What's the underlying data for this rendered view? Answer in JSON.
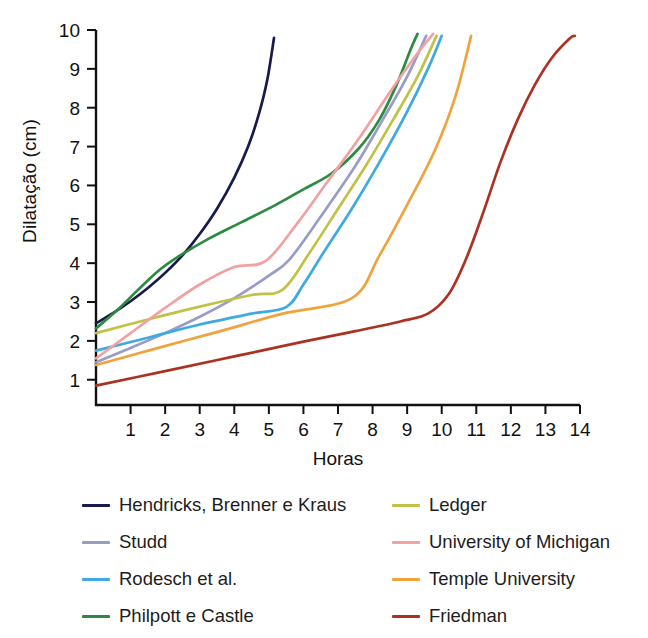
{
  "chart_data": {
    "type": "line",
    "title": "",
    "xlabel": "Horas",
    "ylabel": "Dilatação (cm)",
    "xlim": [
      0,
      14
    ],
    "ylim": [
      0.35,
      10
    ],
    "xticks": [
      1,
      2,
      3,
      4,
      5,
      6,
      7,
      8,
      9,
      10,
      11,
      12,
      13,
      14
    ],
    "yticks": [
      1,
      2,
      3,
      4,
      5,
      6,
      7,
      8,
      9,
      10
    ],
    "grid": false,
    "legend_position": "below",
    "legend_columns": 2,
    "series": [
      {
        "name": "Hendricks, Brenner e Kraus",
        "color": "#171a4a",
        "points": [
          [
            0,
            2.45
          ],
          [
            0.5,
            2.72
          ],
          [
            1.0,
            3.02
          ],
          [
            1.5,
            3.36
          ],
          [
            2.0,
            3.75
          ],
          [
            2.5,
            4.2
          ],
          [
            3.0,
            4.75
          ],
          [
            3.5,
            5.4
          ],
          [
            4.0,
            6.2
          ],
          [
            4.4,
            7.0
          ],
          [
            4.7,
            7.8
          ],
          [
            4.95,
            8.7
          ],
          [
            5.15,
            9.8
          ]
        ]
      },
      {
        "name": "Studd",
        "color": "#9a9cc8",
        "points": [
          [
            0,
            1.45
          ],
          [
            1.0,
            1.82
          ],
          [
            2.0,
            2.2
          ],
          [
            3.0,
            2.62
          ],
          [
            4.0,
            3.1
          ],
          [
            5.0,
            3.68
          ],
          [
            5.6,
            4.1
          ],
          [
            6.5,
            5.2
          ],
          [
            7.5,
            6.5
          ],
          [
            8.3,
            7.7
          ],
          [
            9.0,
            8.8
          ],
          [
            9.55,
            9.85
          ]
        ]
      },
      {
        "name": "Rodesch et al.",
        "color": "#3eaae0",
        "points": [
          [
            0,
            1.75
          ],
          [
            1.5,
            2.08
          ],
          [
            3.0,
            2.42
          ],
          [
            4.5,
            2.7
          ],
          [
            5.5,
            2.87
          ],
          [
            6.0,
            3.45
          ],
          [
            6.6,
            4.3
          ],
          [
            7.4,
            5.4
          ],
          [
            8.2,
            6.6
          ],
          [
            9.0,
            7.9
          ],
          [
            9.6,
            9.0
          ],
          [
            10.0,
            9.85
          ]
        ]
      },
      {
        "name": "Philpott e Castle",
        "color": "#2d8a40",
        "points": [
          [
            0,
            2.32
          ],
          [
            0.6,
            2.78
          ],
          [
            1.2,
            3.3
          ],
          [
            1.8,
            3.8
          ],
          [
            2.4,
            4.18
          ],
          [
            3.2,
            4.6
          ],
          [
            4.2,
            5.05
          ],
          [
            5.2,
            5.5
          ],
          [
            6.0,
            5.9
          ],
          [
            6.8,
            6.3
          ],
          [
            7.6,
            6.95
          ],
          [
            8.2,
            7.7
          ],
          [
            8.7,
            8.6
          ],
          [
            9.1,
            9.5
          ],
          [
            9.3,
            9.9
          ]
        ]
      },
      {
        "name": "Ledger",
        "color": "#c0c246",
        "points": [
          [
            0,
            2.2
          ],
          [
            1.5,
            2.55
          ],
          [
            3.0,
            2.88
          ],
          [
            4.5,
            3.18
          ],
          [
            5.4,
            3.32
          ],
          [
            6.2,
            4.3
          ],
          [
            7.0,
            5.4
          ],
          [
            7.8,
            6.5
          ],
          [
            8.6,
            7.7
          ],
          [
            9.3,
            8.8
          ],
          [
            9.85,
            9.85
          ]
        ]
      },
      {
        "name": "University of Michigan",
        "color": "#f0a2a0",
        "points": [
          [
            0,
            1.55
          ],
          [
            1.0,
            2.2
          ],
          [
            2.0,
            2.85
          ],
          [
            3.0,
            3.45
          ],
          [
            4.0,
            3.9
          ],
          [
            4.9,
            4.05
          ],
          [
            5.8,
            5.0
          ],
          [
            6.7,
            6.1
          ],
          [
            7.6,
            7.2
          ],
          [
            8.5,
            8.4
          ],
          [
            9.3,
            9.4
          ],
          [
            9.75,
            9.9
          ]
        ]
      },
      {
        "name": "Temple University",
        "color": "#f0a33d",
        "points": [
          [
            0,
            1.38
          ],
          [
            1.8,
            1.82
          ],
          [
            3.6,
            2.25
          ],
          [
            5.4,
            2.7
          ],
          [
            7.4,
            3.1
          ],
          [
            8.2,
            4.2
          ],
          [
            9.0,
            5.5
          ],
          [
            9.8,
            6.9
          ],
          [
            10.4,
            8.3
          ],
          [
            10.85,
            9.85
          ]
        ]
      },
      {
        "name": "Friedman",
        "color": "#ab3223",
        "points": [
          [
            0,
            0.85
          ],
          [
            2.0,
            1.22
          ],
          [
            4.0,
            1.6
          ],
          [
            6.0,
            1.98
          ],
          [
            7.5,
            2.25
          ],
          [
            8.8,
            2.5
          ],
          [
            9.6,
            2.7
          ],
          [
            10.2,
            3.2
          ],
          [
            10.7,
            4.1
          ],
          [
            11.2,
            5.3
          ],
          [
            11.7,
            6.6
          ],
          [
            12.2,
            7.7
          ],
          [
            12.7,
            8.6
          ],
          [
            13.2,
            9.3
          ],
          [
            13.7,
            9.78
          ],
          [
            13.85,
            9.85
          ]
        ]
      }
    ]
  },
  "legend": {
    "left_column": [
      {
        "label": "Hendricks, Brenner e Kraus",
        "color": "#171a4a"
      },
      {
        "label": "Studd",
        "color": "#9a9cc8"
      },
      {
        "label": "Rodesch et al.",
        "color": "#3eaae0"
      },
      {
        "label": "Philpott e Castle",
        "color": "#2d8a40"
      }
    ],
    "right_column": [
      {
        "label": "Ledger",
        "color": "#c0c246"
      },
      {
        "label": "University of Michigan",
        "color": "#f0a2a0"
      },
      {
        "label": "Temple University",
        "color": "#f0a33d"
      },
      {
        "label": "Friedman",
        "color": "#ab3223"
      }
    ]
  }
}
